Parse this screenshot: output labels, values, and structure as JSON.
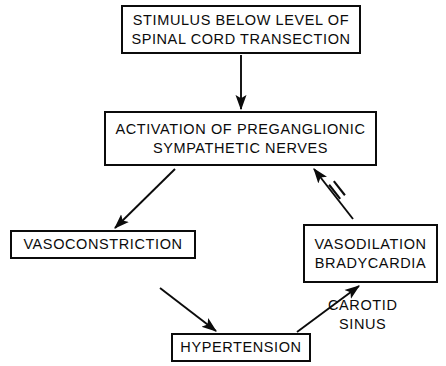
{
  "diagram": {
    "background_color": "#ffffff",
    "stroke_color": "#0b0b0b",
    "nodes": [
      {
        "id": "stimulus",
        "name": "node-stimulus",
        "lines": [
          "STIMULUS BELOW LEVEL OF",
          "SPINAL CORD TRANSECTION"
        ],
        "x": 121,
        "y": 5,
        "w": 240,
        "h": 49,
        "font_size": 14.5
      },
      {
        "id": "activation",
        "name": "node-activation",
        "lines": [
          "ACTIVATION OF PREGANGLIONIC",
          "SYMPATHETIC NERVES"
        ],
        "x": 104,
        "y": 111,
        "w": 273,
        "h": 55,
        "font_size": 14.5
      },
      {
        "id": "vasoconstriction",
        "name": "node-vasoconstriction",
        "lines": [
          "VASOCONSTRICTION"
        ],
        "x": 10,
        "y": 230,
        "w": 186,
        "h": 29,
        "font_size": 14.5
      },
      {
        "id": "vasodilation",
        "name": "node-vasodilation",
        "lines": [
          "VASODILATION",
          "BRADYCARDIA"
        ],
        "x": 303,
        "y": 224,
        "w": 135,
        "h": 59,
        "font_size": 14.5
      },
      {
        "id": "hypertension",
        "name": "node-hypertension",
        "lines": [
          "HYPERTENSION"
        ],
        "x": 171,
        "y": 333,
        "w": 140,
        "h": 29,
        "font_size": 14.5
      }
    ],
    "labels": [
      {
        "id": "carotid-sinus",
        "name": "label-carotid-sinus",
        "lines": [
          "CAROTID",
          "SINUS"
        ],
        "x": 328,
        "y": 296,
        "font_size": 14.5
      }
    ],
    "edges": [
      {
        "id": "stimulus-to-activation",
        "name": "edge-stimulus-to-activation",
        "from": "stimulus",
        "to": "activation",
        "x1": 241,
        "y1": 55,
        "x2": 241,
        "y2": 109,
        "arrow": "end",
        "inhibitor": false
      },
      {
        "id": "activation-to-vasoconstriction",
        "name": "edge-activation-to-vasoconstriction",
        "from": "activation",
        "to": "vasoconstriction",
        "x1": 175,
        "y1": 169,
        "x2": 115,
        "y2": 228,
        "arrow": "end",
        "inhibitor": false
      },
      {
        "id": "vasoconstriction-to-hypertension",
        "name": "edge-vasoconstriction-to-hypertension",
        "from": "vasoconstriction",
        "to": "hypertension",
        "x1": 160,
        "y1": 288,
        "x2": 216,
        "y2": 331,
        "arrow": "end",
        "inhibitor": false
      },
      {
        "id": "hypertension-to-vasodilation",
        "name": "edge-hypertension-to-vasodilation",
        "from": "hypertension",
        "to": "vasodilation",
        "x1": 297,
        "y1": 332,
        "x2": 359,
        "y2": 286,
        "arrow": "end",
        "inhibitor": false
      },
      {
        "id": "vasodilation-inhibits-activation",
        "name": "edge-vasodilation-inhibits-activation",
        "from": "vasodilation",
        "to": "activation",
        "x1": 353,
        "y1": 219,
        "x2": 314,
        "y2": 169,
        "arrow": "end",
        "inhibitor": true,
        "inhibitor_x": 337,
        "inhibitor_y": 190
      }
    ]
  }
}
